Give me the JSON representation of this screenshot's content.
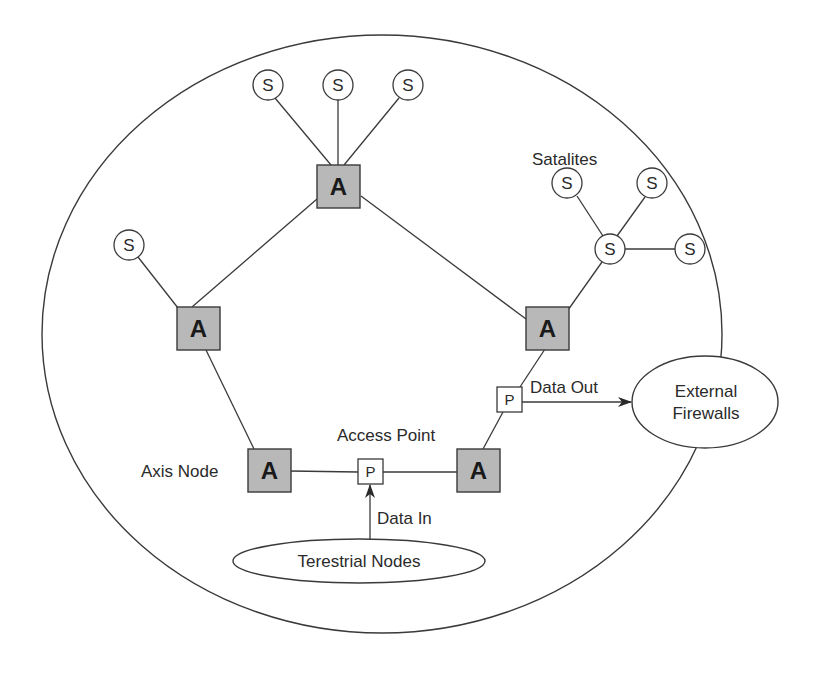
{
  "diagram": {
    "type": "network-topology",
    "boundary": {
      "name": "network-boundary",
      "shape": "ellipse"
    },
    "axis_nodes": [
      {
        "id": "A-top",
        "label": "A"
      },
      {
        "id": "A-left",
        "label": "A"
      },
      {
        "id": "A-right",
        "label": "A"
      },
      {
        "id": "A-bottom-left",
        "label": "A"
      },
      {
        "id": "A-bottom-right",
        "label": "A"
      }
    ],
    "satellites": [
      {
        "id": "S-top-1",
        "label": "S"
      },
      {
        "id": "S-top-2",
        "label": "S"
      },
      {
        "id": "S-top-3",
        "label": "S"
      },
      {
        "id": "S-left",
        "label": "S"
      },
      {
        "id": "S-hub",
        "label": "S"
      },
      {
        "id": "S-cluster-1",
        "label": "S"
      },
      {
        "id": "S-cluster-2",
        "label": "S"
      },
      {
        "id": "S-cluster-3",
        "label": "S"
      }
    ],
    "access_points": [
      {
        "id": "P-out",
        "label": "P"
      },
      {
        "id": "P-in",
        "label": "P"
      }
    ],
    "external": {
      "firewalls_line1": "External",
      "firewalls_line2": "Firewalls",
      "terrestrial": "Terestrial Nodes"
    },
    "labels": {
      "satellites": "Satalites",
      "axis_node": "Axis Node",
      "access_point": "Access Point",
      "data_in": "Data In",
      "data_out": "Data Out"
    },
    "edges": [
      [
        "S-top-1",
        "A-top"
      ],
      [
        "S-top-2",
        "A-top"
      ],
      [
        "S-top-3",
        "A-top"
      ],
      [
        "A-top",
        "A-left"
      ],
      [
        "A-top",
        "A-right"
      ],
      [
        "S-left",
        "A-left"
      ],
      [
        "A-left",
        "A-bottom-left"
      ],
      [
        "A-bottom-left",
        "P-in"
      ],
      [
        "P-in",
        "A-bottom-right"
      ],
      [
        "A-bottom-right",
        "P-out"
      ],
      [
        "P-out",
        "A-right"
      ],
      [
        "A-right",
        "S-hub"
      ],
      [
        "S-hub",
        "S-cluster-1"
      ],
      [
        "S-hub",
        "S-cluster-2"
      ],
      [
        "S-hub",
        "S-cluster-3"
      ]
    ],
    "arrows": [
      {
        "from": "Terestrial Nodes",
        "to": "P-in",
        "label": "Data In"
      },
      {
        "from": "P-out",
        "to": "External Firewalls",
        "label": "Data Out"
      }
    ],
    "colors": {
      "axis_fill": "#b8b8b8",
      "line": "#3a3a3a",
      "background": "#ffffff"
    }
  }
}
